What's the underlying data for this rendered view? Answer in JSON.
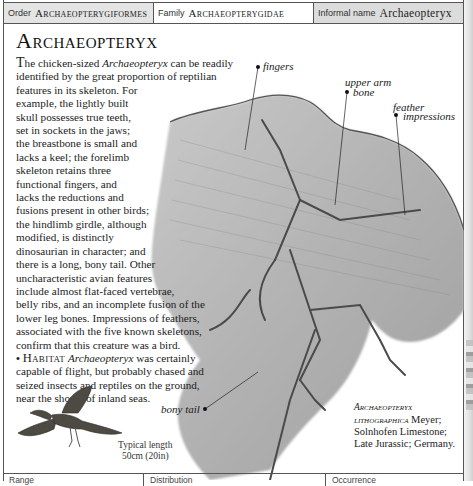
{
  "header": {
    "order_label": "Order",
    "order_value": "Archaeopterygiformes",
    "family_label": "Family",
    "family_value": "Archaeopterygidae",
    "informal_label": "Informal name",
    "informal_value": "Archaeopteryx"
  },
  "title": "Archaeopteryx",
  "description": {
    "drop_cap": "T",
    "lines": [
      [
        "he chicken-sized ",
        "Archaeopteryx",
        " can be readily"
      ],
      [
        "identified by the great proportion of reptilian"
      ],
      [
        "features in its skeleton. For"
      ],
      [
        "example, the lightly built"
      ],
      [
        "skull possesses true teeth,"
      ],
      [
        "set in sockets in the jaws;"
      ],
      [
        "the breastbone is small and"
      ],
      [
        "lacks a keel; the forelimb"
      ],
      [
        "skeleton retains three"
      ],
      [
        "functional fingers, and"
      ],
      [
        "lacks the reductions and"
      ],
      [
        "fusions present in other birds;"
      ],
      [
        "the hindlimb girdle, although"
      ],
      [
        "modified, is distinctly"
      ],
      [
        "dinosaurian in character; and"
      ],
      [
        "there is a long, bony tail. Other"
      ],
      [
        "uncharacteristic avian features"
      ],
      [
        "include almost flat-faced vertebrae,"
      ],
      [
        "belly ribs, and an incomplete fusion of the"
      ],
      [
        "lower leg bones. Impressions of feathers,"
      ],
      [
        "associated with the five known skeletons,"
      ],
      [
        "confirm that this creature was a bird."
      ]
    ],
    "line_1_pre": "he chicken-sized ",
    "line_1_italic": "Archaeopteryx",
    "line_1_post": " can be readily"
  },
  "habitat": {
    "bullet": "•",
    "heading": "Habitat",
    "italic_name": "Archaeopteryx",
    "text_1": " was certainly",
    "line_2": "capable of flight, but probably chased and",
    "line_3": "seized insects and reptiles on the ground,",
    "line_4": "near the shores of inland seas."
  },
  "callouts": {
    "fingers": "fingers",
    "upper_arm_1": "upper arm",
    "upper_arm_2": "bone",
    "feather_1": "feather",
    "feather_2": "impressions",
    "bony_tail": "bony tail"
  },
  "caption": {
    "species_1": "Archaeopteryx",
    "species_2": "lithographica",
    "author": " Meyer;",
    "formation": "Solnhofen Limestone;",
    "age_place": "Late Jurassic; Germany."
  },
  "size": {
    "label": "Typical length",
    "value": "50cm (20in)"
  },
  "footer": {
    "range_label": "Range",
    "distribution_label": "Distribution",
    "occurrence_label": "Occurrence"
  },
  "colors": {
    "header_gray": "#e4e4e4",
    "border": "#555555",
    "fossil_stone": "#b4b4b4"
  }
}
